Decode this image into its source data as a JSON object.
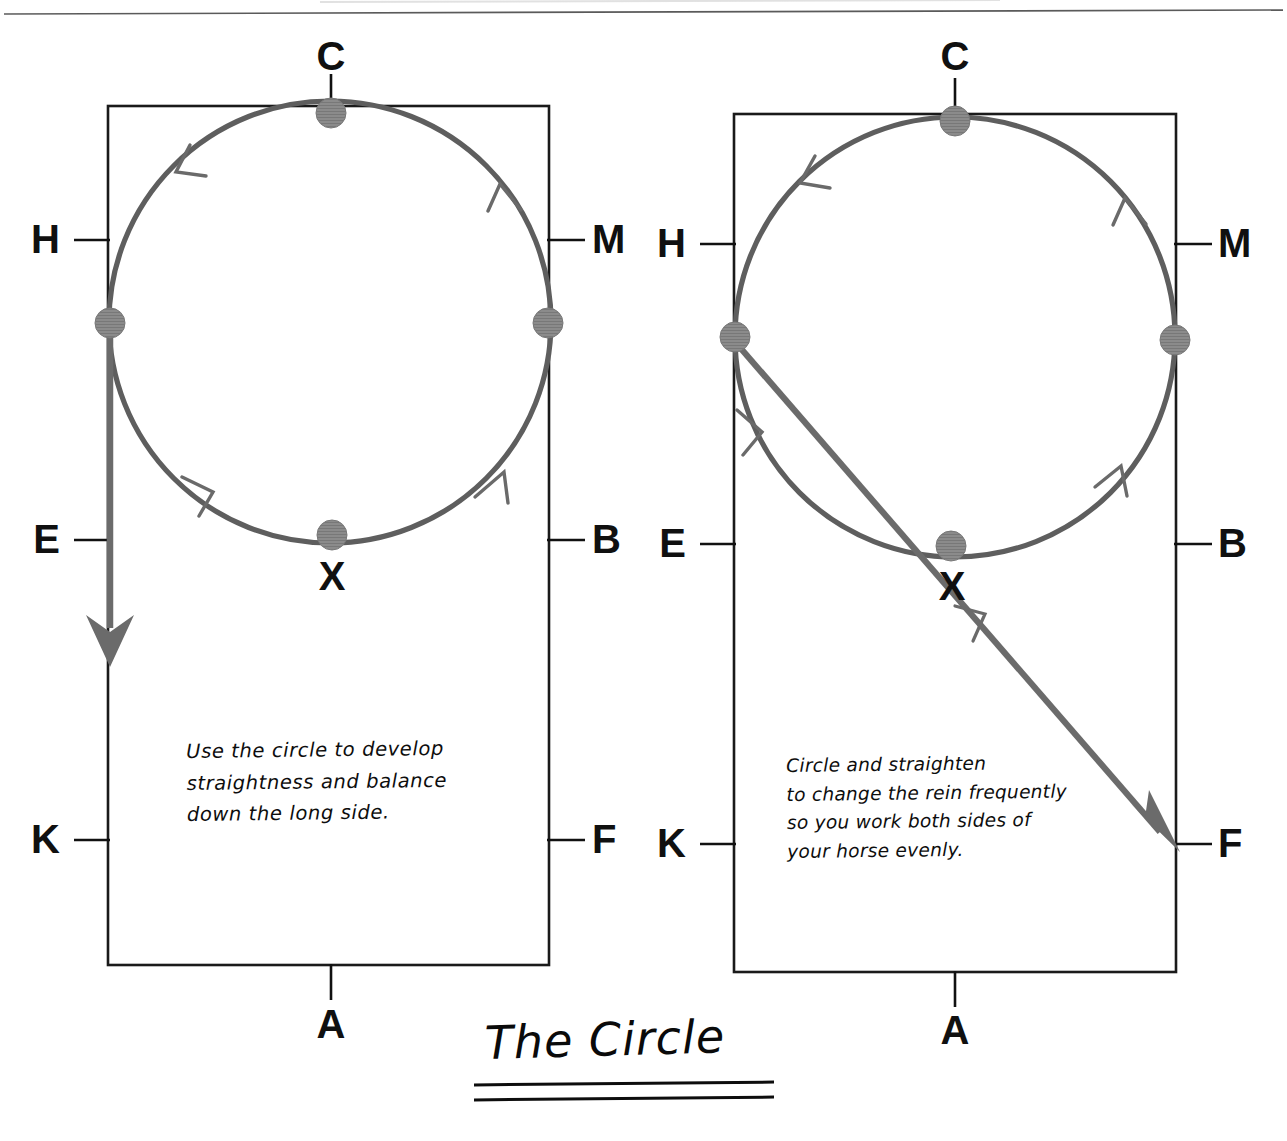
{
  "page": {
    "width": 1287,
    "height": 1141,
    "background": "#ffffff",
    "header_rule": true,
    "title": "The Circle",
    "title_underline_count": 2
  },
  "colors": {
    "ink_black": "#101010",
    "arena_line": "#1a1a1a",
    "path_gray": "#5e5e5e",
    "dot_gray": "#8b8b8b",
    "dot_stroke": "#6f6f6f"
  },
  "diagrams": [
    {
      "id": "left-arena",
      "name": "Use the circle on the long side",
      "arena": {
        "x": 108,
        "y": 106,
        "width": 441,
        "height": 859
      },
      "markers": [
        {
          "letter": "C",
          "position": "top-center",
          "x": 331,
          "y": 44,
          "tick": "vertical"
        },
        {
          "letter": "H",
          "position": "left-upper",
          "x": 40,
          "y": 218,
          "tick": "horizontal"
        },
        {
          "letter": "M",
          "position": "right-upper",
          "x": 600,
          "y": 218,
          "tick": "horizontal"
        },
        {
          "letter": "E",
          "position": "left-middle",
          "x": 40,
          "y": 518,
          "tick": "horizontal"
        },
        {
          "letter": "B",
          "position": "right-middle",
          "x": 600,
          "y": 518,
          "tick": "horizontal"
        },
        {
          "letter": "K",
          "position": "left-lower",
          "x": 40,
          "y": 818,
          "tick": "horizontal"
        },
        {
          "letter": "F",
          "position": "right-lower",
          "x": 600,
          "y": 818,
          "tick": "horizontal"
        },
        {
          "letter": "A",
          "position": "bottom-center",
          "x": 331,
          "y": 1008,
          "tick": "vertical"
        }
      ],
      "circle": {
        "cx": 330,
        "cy": 322,
        "r": 222,
        "direction": "anticlockwise",
        "arrow_count": 3
      },
      "dots": [
        {
          "label": "C",
          "cx": 331,
          "cy": 113
        },
        {
          "label": "left-wall",
          "cx": 110,
          "cy": 323
        },
        {
          "label": "right-wall",
          "cx": 548,
          "cy": 323
        },
        {
          "label": "X",
          "cx": 332,
          "cy": 535
        }
      ],
      "straight_line": {
        "x1": 110,
        "y1": 322,
        "x2": 110,
        "y2": 660,
        "arrow": "down"
      },
      "x_label": {
        "letter": "X",
        "x": 332,
        "y": 562
      },
      "note": "Use the circle to develop\nstraightness and balance\ndown the long side."
    },
    {
      "id": "right-arena",
      "name": "Circle and straighten across the diagonal",
      "arena": {
        "x": 734,
        "y": 114,
        "width": 442,
        "height": 858
      },
      "markers": [
        {
          "letter": "C",
          "position": "top-center",
          "x": 955,
          "y": 44,
          "tick": "vertical"
        },
        {
          "letter": "H",
          "position": "left-upper",
          "x": 666,
          "y": 222,
          "tick": "horizontal"
        },
        {
          "letter": "M",
          "position": "right-upper",
          "x": 1226,
          "y": 222,
          "tick": "horizontal"
        },
        {
          "letter": "E",
          "position": "left-middle",
          "x": 666,
          "y": 522,
          "tick": "horizontal"
        },
        {
          "letter": "B",
          "position": "right-middle",
          "x": 1226,
          "y": 522,
          "tick": "horizontal"
        },
        {
          "letter": "K",
          "position": "left-lower",
          "x": 666,
          "y": 822,
          "tick": "horizontal"
        },
        {
          "letter": "F",
          "position": "right-lower",
          "x": 1226,
          "y": 822,
          "tick": "horizontal"
        },
        {
          "letter": "A",
          "position": "bottom-center",
          "x": 955,
          "y": 1008,
          "tick": "vertical"
        }
      ],
      "circle": {
        "cx": 955,
        "cy": 337,
        "r": 222,
        "direction": "anticlockwise",
        "arrow_count": 3
      },
      "dots": [
        {
          "label": "C",
          "cx": 955,
          "cy": 121
        },
        {
          "label": "left-wall",
          "cx": 735,
          "cy": 337
        },
        {
          "label": "right-wall",
          "cx": 1175,
          "cy": 340
        },
        {
          "label": "X",
          "cx": 951,
          "cy": 546
        }
      ],
      "diagonal_line": {
        "x1": 738,
        "y1": 345,
        "x2": 1174,
        "y2": 848,
        "arrow": "down-right"
      },
      "x_label": {
        "letter": "X",
        "x": 952,
        "y": 572
      },
      "note": "Circle and straighten\nto change the rein frequently\nso you work both sides of\nyour horse evenly."
    }
  ]
}
